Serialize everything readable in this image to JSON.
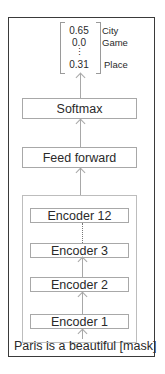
{
  "diagram": {
    "output": {
      "probabilities": [
        "0.65",
        "0.0",
        "⋮",
        "0.31"
      ],
      "labels": [
        "City",
        "Game",
        "",
        "Place"
      ]
    },
    "softmax_label": "Softmax",
    "feed_forward_label": "Feed forward",
    "encoders": [
      {
        "label": "Encoder 12"
      },
      {
        "label": "Encoder 3"
      },
      {
        "label": "Encoder 2"
      },
      {
        "label": "Encoder 1"
      }
    ],
    "input_text": "Paris is a beautiful [mask]",
    "colors": {
      "frame_border": "#3a3a3a",
      "box_border": "#a8a8a8",
      "text": "#2a2a2a"
    }
  }
}
